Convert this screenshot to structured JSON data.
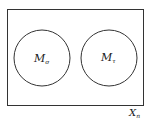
{
  "diagram": {
    "outer_set": {
      "label": "X",
      "subscript": "n"
    },
    "circles": [
      {
        "label": "M",
        "subscript": "σ"
      },
      {
        "label": "M",
        "subscript": "τ"
      }
    ],
    "stroke_color": "#333333"
  }
}
